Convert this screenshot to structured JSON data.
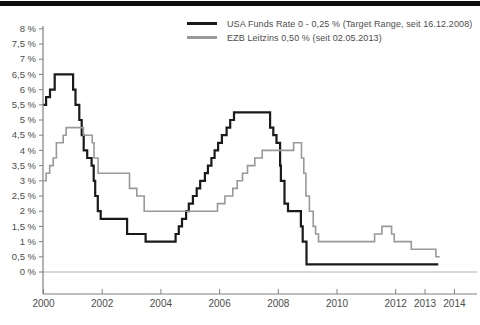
{
  "page": {
    "background": "#ffffff",
    "top_bar_color": "#0d0d0d"
  },
  "legend": {
    "items": [
      {
        "label": "USA Funds Rate 0 - 0,25 % (Target Range, seit 16.12.2008)",
        "color": "#1a1a1a"
      },
      {
        "label": "EZB Leitzins 0,50 % (seit 02.05.2013)",
        "color": "#999999"
      }
    ]
  },
  "chart_data": {
    "type": "line",
    "line_style": "step-after",
    "title": "",
    "xlabel": "",
    "ylabel": "",
    "x_range": [
      2000,
      2014
    ],
    "y_range": [
      0,
      8
    ],
    "grid": "zero-line-only",
    "legend_position": "top",
    "axis_color": "#808080",
    "zero_line_color": "#b3b3b3",
    "label_color": "#4d4d4d",
    "y_ticks": [
      {
        "value": 8,
        "label": "8 %"
      },
      {
        "value": 7.5,
        "label": "7,5 %"
      },
      {
        "value": 7,
        "label": "7 %"
      },
      {
        "value": 6.5,
        "label": "6,5 %"
      },
      {
        "value": 6,
        "label": "6 %"
      },
      {
        "value": 5.5,
        "label": "5,5 %"
      },
      {
        "value": 5,
        "label": "5 %"
      },
      {
        "value": 4.5,
        "label": "4,5 %"
      },
      {
        "value": 4,
        "label": "4 %"
      },
      {
        "value": 3.5,
        "label": "3,5 %"
      },
      {
        "value": 3,
        "label": "3 %"
      },
      {
        "value": 2.5,
        "label": "2,5 %"
      },
      {
        "value": 2,
        "label": "2 %"
      },
      {
        "value": 1.5,
        "label": "1,5 %"
      },
      {
        "value": 1,
        "label": "1 %"
      },
      {
        "value": 0.5,
        "label": "0,5 %"
      },
      {
        "value": 0,
        "label": "0 %"
      }
    ],
    "x_ticks": [
      {
        "value": 2000,
        "label": "2000"
      },
      {
        "value": 2002,
        "label": "2002"
      },
      {
        "value": 2004,
        "label": "2004"
      },
      {
        "value": 2006,
        "label": "2006"
      },
      {
        "value": 2008,
        "label": "2008"
      },
      {
        "value": 2010,
        "label": "2010"
      },
      {
        "value": 2012,
        "label": "2012"
      },
      {
        "value": 2013,
        "label": "2013"
      },
      {
        "value": 2014,
        "label": "2014"
      }
    ],
    "series": [
      {
        "name": "USA Funds Rate",
        "color": "#1a1a1a",
        "width": 2.2,
        "points": [
          [
            2000.0,
            5.5
          ],
          [
            2000.09,
            5.75
          ],
          [
            2000.22,
            6.0
          ],
          [
            2000.38,
            6.5
          ],
          [
            2001.01,
            6.0
          ],
          [
            2001.09,
            5.5
          ],
          [
            2001.22,
            5.0
          ],
          [
            2001.3,
            4.5
          ],
          [
            2001.37,
            4.0
          ],
          [
            2001.49,
            3.75
          ],
          [
            2001.64,
            3.5
          ],
          [
            2001.71,
            3.0
          ],
          [
            2001.76,
            2.5
          ],
          [
            2001.85,
            2.0
          ],
          [
            2001.95,
            1.75
          ],
          [
            2002.85,
            1.25
          ],
          [
            2003.48,
            1.0
          ],
          [
            2004.5,
            1.25
          ],
          [
            2004.61,
            1.5
          ],
          [
            2004.72,
            1.75
          ],
          [
            2004.86,
            2.0
          ],
          [
            2004.95,
            2.25
          ],
          [
            2005.09,
            2.5
          ],
          [
            2005.22,
            2.75
          ],
          [
            2005.34,
            3.0
          ],
          [
            2005.5,
            3.25
          ],
          [
            2005.6,
            3.5
          ],
          [
            2005.72,
            3.75
          ],
          [
            2005.83,
            4.0
          ],
          [
            2005.95,
            4.25
          ],
          [
            2006.08,
            4.5
          ],
          [
            2006.24,
            4.75
          ],
          [
            2006.36,
            5.0
          ],
          [
            2006.49,
            5.25
          ],
          [
            2007.72,
            4.75
          ],
          [
            2007.83,
            4.5
          ],
          [
            2007.94,
            4.25
          ],
          [
            2008.06,
            3.5
          ],
          [
            2008.09,
            3.0
          ],
          [
            2008.21,
            2.25
          ],
          [
            2008.33,
            2.0
          ],
          [
            2008.77,
            1.5
          ],
          [
            2008.83,
            1.0
          ],
          [
            2008.96,
            0.25
          ],
          [
            2013.45,
            0.25
          ]
        ]
      },
      {
        "name": "EZB Leitzins",
        "color": "#999999",
        "width": 1.6,
        "points": [
          [
            2000.0,
            3.0
          ],
          [
            2000.09,
            3.25
          ],
          [
            2000.21,
            3.5
          ],
          [
            2000.33,
            3.75
          ],
          [
            2000.44,
            4.25
          ],
          [
            2000.67,
            4.5
          ],
          [
            2000.77,
            4.75
          ],
          [
            2001.36,
            4.5
          ],
          [
            2001.66,
            4.25
          ],
          [
            2001.72,
            3.75
          ],
          [
            2001.86,
            3.25
          ],
          [
            2002.93,
            2.75
          ],
          [
            2003.18,
            2.5
          ],
          [
            2003.43,
            2.0
          ],
          [
            2005.93,
            2.25
          ],
          [
            2006.18,
            2.5
          ],
          [
            2006.45,
            2.75
          ],
          [
            2006.6,
            3.0
          ],
          [
            2006.78,
            3.25
          ],
          [
            2006.95,
            3.5
          ],
          [
            2007.2,
            3.75
          ],
          [
            2007.45,
            4.0
          ],
          [
            2008.52,
            4.25
          ],
          [
            2008.79,
            3.75
          ],
          [
            2008.87,
            3.25
          ],
          [
            2008.94,
            2.5
          ],
          [
            2009.06,
            2.0
          ],
          [
            2009.19,
            1.5
          ],
          [
            2009.27,
            1.25
          ],
          [
            2009.37,
            1.0
          ],
          [
            2011.28,
            1.25
          ],
          [
            2011.53,
            1.5
          ],
          [
            2011.86,
            1.25
          ],
          [
            2011.95,
            1.0
          ],
          [
            2012.53,
            0.75
          ],
          [
            2013.37,
            0.5
          ],
          [
            2013.5,
            0.5
          ]
        ]
      }
    ]
  }
}
